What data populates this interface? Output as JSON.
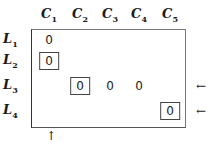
{
  "columns": [
    {
      "label": "C",
      "sub": "1",
      "x": 49
    },
    {
      "label": "C",
      "sub": "2",
      "x": 80
    },
    {
      "label": "C",
      "sub": "3",
      "x": 110
    },
    {
      "label": "C",
      "sub": "4",
      "x": 139
    },
    {
      "label": "C",
      "sub": "5",
      "x": 170
    }
  ],
  "rows": [
    {
      "label": "L",
      "sub": "1",
      "y": 40
    },
    {
      "label": "L",
      "sub": "2",
      "y": 61
    },
    {
      "label": "L",
      "sub": "3",
      "y": 86
    },
    {
      "label": "L",
      "sub": "4",
      "y": 111
    }
  ],
  "cells": [
    {
      "row": 0,
      "col": 0,
      "value": "0",
      "boxed": false
    },
    {
      "row": 1,
      "col": 0,
      "value": "0",
      "boxed": true
    },
    {
      "row": 2,
      "col": 1,
      "value": "0",
      "boxed": true
    },
    {
      "row": 2,
      "col": 2,
      "value": "0",
      "boxed": false
    },
    {
      "row": 2,
      "col": 3,
      "value": "0",
      "boxed": false
    },
    {
      "row": 3,
      "col": 4,
      "value": "0",
      "boxed": true
    }
  ],
  "row_markers": [
    {
      "row": 2,
      "glyph": "←"
    },
    {
      "row": 3,
      "glyph": "←"
    }
  ],
  "col_markers": [
    {
      "col": 0,
      "glyph": "↑"
    }
  ]
}
